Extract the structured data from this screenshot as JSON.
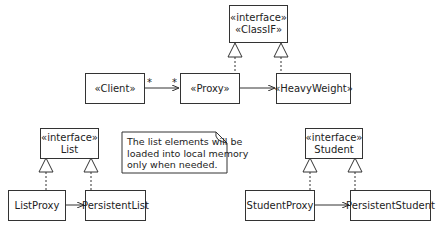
{
  "diagram": {
    "type": "UML class diagram - Proxy pattern",
    "classes": [
      {
        "id": "classif",
        "stereotype": "«interface»",
        "name": "«ClassIF»"
      },
      {
        "id": "client",
        "name": "«Client»"
      },
      {
        "id": "proxy",
        "name": "«Proxy»"
      },
      {
        "id": "heavyweight",
        "name": "«HeavyWeight»"
      },
      {
        "id": "list",
        "stereotype": "«interface»",
        "name": "List"
      },
      {
        "id": "listproxy",
        "name": "ListProxy"
      },
      {
        "id": "persistentlist",
        "name": "PersistentList"
      },
      {
        "id": "student",
        "stereotype": "«interface»",
        "name": "Student"
      },
      {
        "id": "studentproxy",
        "name": "StudentProxy"
      },
      {
        "id": "persistentstudent",
        "name": "PersistentStudent"
      }
    ],
    "note": {
      "lines": [
        "The list elements will be",
        "loaded into local memory",
        "only when needed."
      ]
    },
    "multiplicities": {
      "client_end": "*",
      "proxy_end": "*"
    },
    "relations": [
      {
        "from": "client",
        "to": "proxy",
        "kind": "association"
      },
      {
        "from": "proxy",
        "to": "heavyweight",
        "kind": "association"
      },
      {
        "from": "proxy",
        "to": "classif",
        "kind": "realization"
      },
      {
        "from": "heavyweight",
        "to": "classif",
        "kind": "realization"
      },
      {
        "from": "listproxy",
        "to": "persistentlist",
        "kind": "association"
      },
      {
        "from": "listproxy",
        "to": "list",
        "kind": "realization"
      },
      {
        "from": "persistentlist",
        "to": "list",
        "kind": "realization"
      },
      {
        "from": "studentproxy",
        "to": "persistentstudent",
        "kind": "association"
      },
      {
        "from": "studentproxy",
        "to": "student",
        "kind": "realization"
      },
      {
        "from": "persistentstudent",
        "to": "student",
        "kind": "realization"
      }
    ]
  }
}
